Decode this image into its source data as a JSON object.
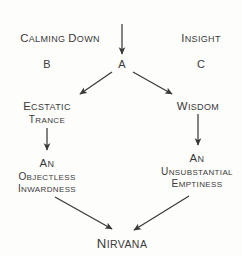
{
  "diagram": {
    "background_color": "#fdfdfc",
    "ink_color": "#3a3a3a",
    "nodes": [
      {
        "id": "mindfulness",
        "text": "Mindfulness",
        "x": 122,
        "y": 10
      },
      {
        "id": "calming-down",
        "text": "Calming down",
        "x": 60,
        "y": 32
      },
      {
        "id": "insight",
        "text": "Insight",
        "x": 201,
        "y": 32
      },
      {
        "id": "letter-b",
        "text": "B",
        "x": 47,
        "y": 58
      },
      {
        "id": "letter-a",
        "text": "A",
        "x": 122,
        "y": 58
      },
      {
        "id": "letter-c",
        "text": "C",
        "x": 201,
        "y": 58
      },
      {
        "id": "ecstatic",
        "line1": "Ecstatic",
        "line2": "trance",
        "x": 47,
        "y": 100
      },
      {
        "id": "wisdom",
        "text": "Wisdom",
        "x": 198,
        "y": 100
      },
      {
        "id": "objectless",
        "line1": "An",
        "line2": "objectless",
        "line3": "inwardness",
        "x": 47,
        "y": 157
      },
      {
        "id": "unsubstantial",
        "line1": "An",
        "line2": "unsubstantial",
        "line3": "emptiness",
        "x": 197,
        "y": 152
      },
      {
        "id": "nirvana",
        "text": "Nirvana",
        "x": 122,
        "y": 236
      }
    ],
    "arrows": [
      {
        "id": "mindfulness-to-a",
        "from": "mindfulness",
        "to": "letter-a",
        "x1": 122,
        "y1": 24,
        "x2": 122,
        "y2": 54
      },
      {
        "id": "a-to-ecstatic",
        "from": "letter-a",
        "to": "ecstatic",
        "x1": 112,
        "y1": 72,
        "x2": 80,
        "y2": 94
      },
      {
        "id": "a-to-wisdom",
        "from": "letter-a",
        "to": "wisdom",
        "x1": 133,
        "y1": 72,
        "x2": 172,
        "y2": 94
      },
      {
        "id": "ecstatic-to-objectless",
        "from": "ecstatic",
        "to": "objectless",
        "x1": 47,
        "y1": 128,
        "x2": 47,
        "y2": 150
      },
      {
        "id": "wisdom-to-unsubstantial",
        "from": "wisdom",
        "to": "unsubstantial",
        "x1": 198,
        "y1": 114,
        "x2": 198,
        "y2": 145
      },
      {
        "id": "objectless-to-nirvana",
        "from": "objectless",
        "to": "nirvana",
        "x1": 55,
        "y1": 197,
        "x2": 112,
        "y2": 229
      },
      {
        "id": "unsubstantial-to-nirvana",
        "from": "unsubstantial",
        "to": "nirvana",
        "x1": 189,
        "y1": 196,
        "x2": 134,
        "y2": 230
      }
    ]
  }
}
